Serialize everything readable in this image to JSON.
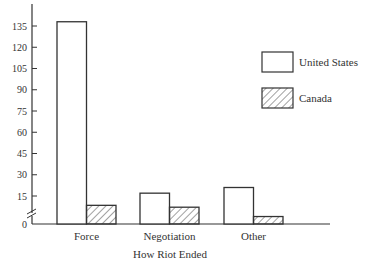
{
  "chart_data": {
    "type": "bar",
    "title": "",
    "xlabel": "How Riot Ended",
    "ylabel": "",
    "categories": [
      "Force",
      "Negotiation",
      "Other"
    ],
    "series": [
      {
        "name": "United States",
        "values": [
          138,
          17,
          21
        ],
        "pattern": "solid-white"
      },
      {
        "name": "Canada",
        "values": [
          10,
          9,
          4
        ],
        "pattern": "hatched"
      }
    ],
    "yticks": [
      0,
      15,
      30,
      45,
      60,
      75,
      90,
      105,
      120,
      135
    ],
    "ylim": [
      0,
      150
    ],
    "axis_break": "between 0 and 15",
    "grid": false,
    "legend_position": "upper right"
  },
  "legend": {
    "items": [
      {
        "label": "United States"
      },
      {
        "label": "Canada"
      }
    ]
  },
  "axis": {
    "xlabel": "How Riot Ended",
    "ytick_labels": [
      "0",
      "15",
      "30",
      "45",
      "60",
      "75",
      "90",
      "105",
      "120",
      "135"
    ],
    "category_labels": [
      "Force",
      "Negotiation",
      "Other"
    ]
  }
}
